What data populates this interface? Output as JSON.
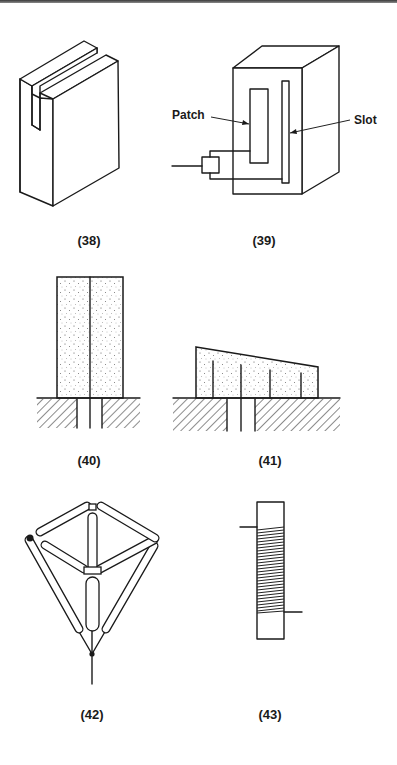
{
  "page": {
    "background": "#ffffff",
    "ink_color": "#1a1a1a"
  },
  "figures": [
    {
      "id": "38",
      "label": "(38)",
      "description": "Slotted block antenna"
    },
    {
      "id": "39",
      "label": "(39)",
      "description": "Box with patch and slot",
      "callouts": {
        "patch": "Patch",
        "slot": "Slot"
      }
    },
    {
      "id": "40",
      "label": "(40)",
      "description": "Dielectric block over ground plane with central feed"
    },
    {
      "id": "41",
      "label": "(41)",
      "description": "Tapered dielectric block with vertical wires over ground plane"
    },
    {
      "id": "42",
      "label": "(42)",
      "description": "Tetrahedral tube frame antenna on feed point"
    },
    {
      "id": "43",
      "label": "(43)",
      "description": "Helical coil wound on rod"
    }
  ]
}
